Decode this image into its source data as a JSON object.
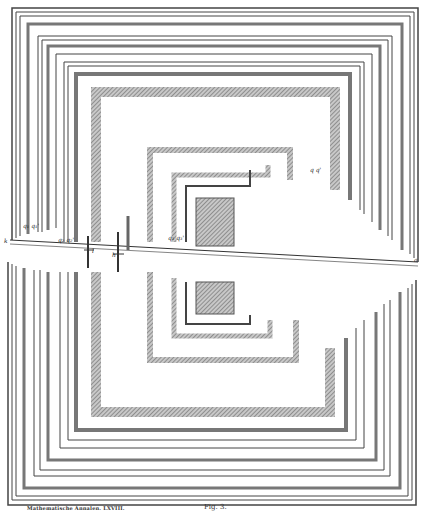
{
  "figure": {
    "caption_left": "Mathematische Annalen. LXVIII.",
    "caption_right": "Fig. 3.",
    "labels": {
      "left_point": "k",
      "right_point": "a",
      "pair_1": "q₁ q₁'",
      "pair_2": "q₂ q₂'",
      "pair_3": "q₃ q₃'",
      "pair_4": "q q'",
      "cut_1": "l",
      "cut_2": "h"
    },
    "colors": {
      "ink": "#3a3a3a",
      "hatch": "#8a8a8a",
      "paper": "#ffffff"
    }
  }
}
